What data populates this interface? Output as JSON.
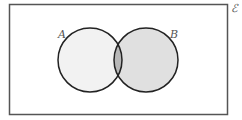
{
  "diagram": {
    "type": "venn",
    "universal_label": "ℰ",
    "sets": [
      {
        "name": "A",
        "label": "A",
        "fill": "#f2f2f2"
      },
      {
        "name": "B",
        "label": "B",
        "fill": "#e0e0e0"
      }
    ],
    "intersection_fill": "#b8b8b8",
    "stroke_color": "#222222",
    "frame_color": "#555555"
  }
}
